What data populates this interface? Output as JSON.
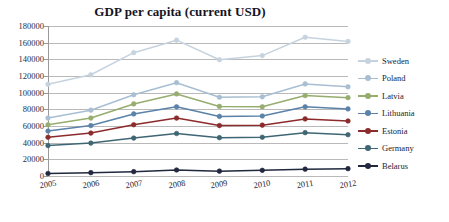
{
  "chart_data": {
    "type": "line",
    "title": "GDP per capita (current USD)",
    "xlabel": "",
    "ylabel": "",
    "categories": [
      "2005",
      "2006",
      "2007",
      "2008",
      "2009",
      "2010",
      "2011",
      "2012"
    ],
    "ylim": [
      0,
      180000
    ],
    "ytick_step": 20000,
    "yticks": [
      "0",
      "20000",
      "40000",
      "60000",
      "80000",
      "100000",
      "120000",
      "140000",
      "160000",
      "180000"
    ],
    "grid": true,
    "legend_position": "right",
    "series": [
      {
        "name": "Sweden",
        "color": "#c6d3df",
        "values": [
          110000,
          121500,
          148000,
          163000,
          139500,
          144500,
          166500,
          161500
        ]
      },
      {
        "name": "Poland",
        "color": "#a8bed2",
        "values": [
          69500,
          79000,
          97500,
          112000,
          94500,
          95000,
          110500,
          107000
        ]
      },
      {
        "name": "Latvia",
        "color": "#96ad6e",
        "values": [
          61500,
          69500,
          86500,
          98500,
          83500,
          83000,
          96500,
          94000
        ]
      },
      {
        "name": "Lithuania",
        "color": "#5b82a8",
        "values": [
          54000,
          60500,
          74500,
          83000,
          71500,
          72000,
          83000,
          80500
        ]
      },
      {
        "name": "Estonia",
        "color": "#8c2b2b",
        "values": [
          46500,
          51500,
          61500,
          69500,
          60500,
          61000,
          68500,
          66000
        ]
      },
      {
        "name": "Germany",
        "color": "#3f6674",
        "values": [
          36500,
          39500,
          45500,
          51000,
          46000,
          46500,
          52000,
          49500
        ]
      },
      {
        "name": "Belarus",
        "color": "#21283f",
        "values": [
          3000,
          4000,
          5200,
          7200,
          5800,
          6800,
          8200,
          8800
        ]
      }
    ]
  }
}
